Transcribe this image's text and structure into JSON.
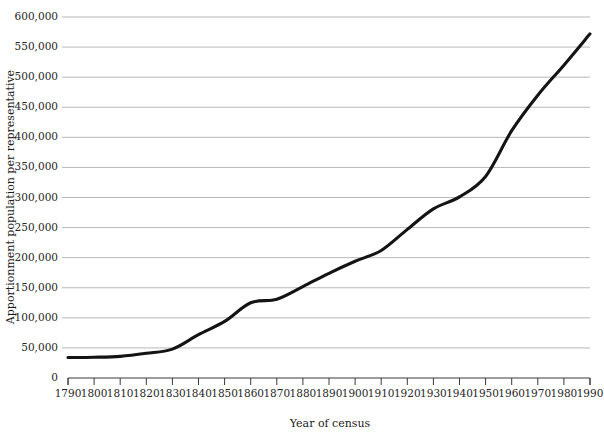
{
  "chart_data": {
    "type": "line",
    "title": "",
    "subtitle": "",
    "xlabel": "Year of census",
    "ylabel": "Apportionment population per representative",
    "x": [
      1790,
      1800,
      1810,
      1820,
      1830,
      1840,
      1850,
      1860,
      1870,
      1880,
      1890,
      1900,
      1910,
      1920,
      1930,
      1940,
      1950,
      1960,
      1970,
      1980,
      1990
    ],
    "values": [
      34000,
      34500,
      36000,
      41000,
      48000,
      72000,
      94000,
      125000,
      131000,
      152000,
      174000,
      194000,
      212000,
      247000,
      281000,
      301000,
      335000,
      411000,
      470000,
      520000,
      572000
    ],
    "series": [
      {
        "name": "Apportionment population per representative",
        "values": [
          34000,
          34500,
          36000,
          41000,
          48000,
          72000,
          94000,
          125000,
          131000,
          152000,
          174000,
          194000,
          212000,
          247000,
          281000,
          301000,
          335000,
          411000,
          470000,
          520000,
          572000
        ]
      }
    ],
    "xticks": [
      "1790",
      "1800",
      "1810",
      "1820",
      "1830",
      "1840",
      "1850",
      "1860",
      "1870",
      "1880",
      "1890",
      "1900",
      "1910",
      "1920",
      "1930",
      "1940",
      "1950",
      "1960",
      "1970",
      "1980",
      "1990"
    ],
    "yticks": [
      "0",
      "50,000",
      "100,000",
      "150,000",
      "200,000",
      "250,000",
      "300,000",
      "350,000",
      "400,000",
      "450,000",
      "500,000",
      "550,000",
      "600,000"
    ],
    "ytick_values": [
      0,
      50000,
      100000,
      150000,
      200000,
      250000,
      300000,
      350000,
      400000,
      450000,
      500000,
      550000,
      600000
    ],
    "xlim": [
      1790,
      1990
    ],
    "ylim": [
      0,
      600000
    ],
    "grid": true,
    "grid_axis": "y",
    "legend": false,
    "legend_position": "none",
    "line_color": "#141414",
    "grid_color": "#9a9a9a",
    "axis_color": "#3a3a3a",
    "background_color": "#ffffff"
  }
}
